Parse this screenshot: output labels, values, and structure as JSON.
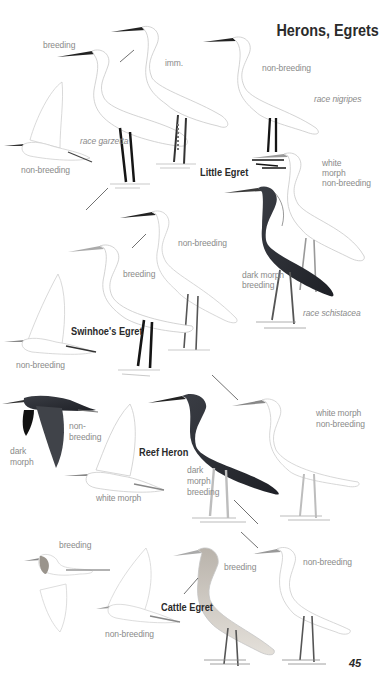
{
  "page": {
    "title": "Herons, Egrets",
    "page_number": "45"
  },
  "species": {
    "little_egret": {
      "name": "Little Egret",
      "labels": {
        "breeding": "breeding",
        "imm": "imm.",
        "non_breeding_top": "non-breeding",
        "race_nigripes": "race nigripes",
        "race_garzetta": "race garzetta",
        "non_breeding_flight": "non-breeding"
      }
    },
    "swinhoes_egret": {
      "name": "Swinhoe's Egret",
      "labels": {
        "non_breeding": "non-breeding",
        "breeding": "breeding",
        "non_breeding_flight": "non-breeding"
      }
    },
    "western_reef_heron": {
      "labels": {
        "white_morph_non_breeding": [
          "white",
          "morph",
          "non-breeding"
        ],
        "dark_morph_breeding": [
          "dark morph",
          "breeding"
        ],
        "race_schistacea": "race schistacea"
      }
    },
    "reef_heron": {
      "name": "Reef Heron",
      "labels": {
        "dark_morph_flight": [
          "dark",
          "morph"
        ],
        "non_breeding_flight": [
          "non-",
          "breeding"
        ],
        "white_morph_flight": "white morph",
        "dark_morph_breeding": [
          "dark",
          "morph",
          "breeding"
        ],
        "white_morph_non_breeding": [
          "white morph",
          "non-breeding"
        ]
      }
    },
    "cattle_egret": {
      "name": "Cattle Egret",
      "labels": {
        "breeding_flight": "breeding",
        "non_breeding_flight": "non-breeding",
        "breeding": "breeding",
        "non_breeding": "non-breeding"
      }
    }
  },
  "colors": {
    "ink": "#2a2a2a",
    "label_grey": "#8a8a8a",
    "dark_morph": "#2c2f35",
    "outline": "#c4c4c4",
    "leg_black": "#1a1a1a",
    "buff": "#c9c1b5"
  }
}
